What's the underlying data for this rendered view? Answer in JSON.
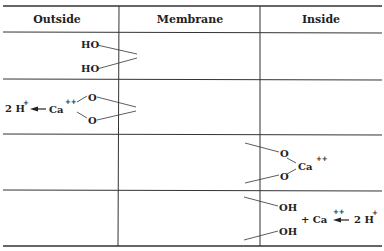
{
  "table": {
    "columns": [
      "Outside",
      "Membrane",
      "Inside"
    ],
    "rows": [
      {
        "step": 1,
        "outside": [
          "HO",
          "HO"
        ],
        "membrane": "",
        "inside": ""
      },
      {
        "step": 2,
        "outside": {
          "left": "2 H",
          "left_sup": "+",
          "ion": "Ca",
          "ion_sup": "++",
          "oxygens": [
            "O",
            "O"
          ]
        },
        "membrane": "",
        "inside": ""
      },
      {
        "step": 3,
        "outside": "",
        "membrane": "",
        "inside": {
          "oxygens": [
            "O",
            "O"
          ],
          "ion": "Ca",
          "ion_sup": "++"
        }
      },
      {
        "step": 4,
        "outside": "",
        "membrane": "",
        "inside": {
          "groups": [
            "OH",
            "OH"
          ],
          "plus": "+ Ca",
          "ion_sup": "++",
          "right": "2 H",
          "right_sup": "+"
        }
      }
    ]
  }
}
